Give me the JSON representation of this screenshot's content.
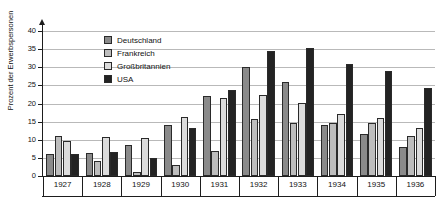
{
  "chart_data": {
    "type": "bar",
    "title": "",
    "xlabel": "",
    "ylabel": "Prozent der Erwerbspersonen",
    "ylim": [
      0,
      40
    ],
    "ytick_step": 5,
    "yticks": [
      0,
      5,
      10,
      15,
      20,
      25,
      30,
      35,
      40
    ],
    "grid": true,
    "legend_position": "top-left-inside",
    "categories": [
      "1927",
      "1928",
      "1929",
      "1930",
      "1931",
      "1932",
      "1933",
      "1934",
      "1935",
      "1936"
    ],
    "series": [
      {
        "name": "Deutschland",
        "color": "#8a8a8a",
        "values": [
          6.2,
          6.3,
          8.5,
          14.2,
          22.2,
          30.1,
          26.0,
          14.2,
          11.6,
          8.1
        ]
      },
      {
        "name": "Frankreich",
        "color": "#bdbdbd",
        "values": [
          11.0,
          4.1,
          1.0,
          3.0,
          6.8,
          15.6,
          14.5,
          14.5,
          14.5,
          11.0
        ]
      },
      {
        "name": "Großbritannien",
        "color": "#dcdcdc",
        "values": [
          9.7,
          10.8,
          10.4,
          16.3,
          21.6,
          22.4,
          20.2,
          17.0,
          15.9,
          13.3
        ]
      },
      {
        "name": "USA",
        "color": "#232323",
        "values": [
          6.0,
          6.5,
          5.0,
          13.2,
          23.6,
          34.5,
          35.3,
          31.0,
          28.9,
          24.3
        ]
      }
    ]
  },
  "axis": {
    "y_axis_color": "#1d1d1d",
    "grid_color": "#b9b9b9"
  }
}
